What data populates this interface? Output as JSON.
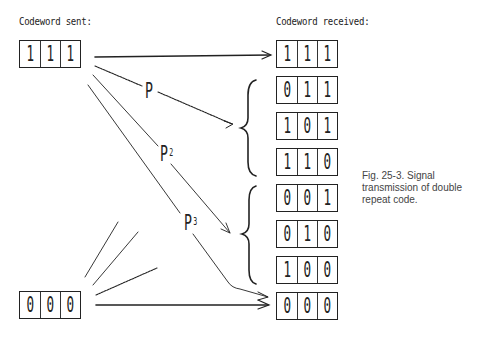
{
  "headings": {
    "sent": "Codeword sent:",
    "received": "Codeword received:"
  },
  "sent_codewords": [
    {
      "bits": [
        "1",
        "1",
        "1"
      ]
    },
    {
      "bits": [
        "0",
        "0",
        "0"
      ]
    }
  ],
  "received_codewords": [
    {
      "bits": [
        "1",
        "1",
        "1"
      ]
    },
    {
      "bits": [
        "0",
        "1",
        "1"
      ]
    },
    {
      "bits": [
        "1",
        "0",
        "1"
      ]
    },
    {
      "bits": [
        "1",
        "1",
        "0"
      ]
    },
    {
      "bits": [
        "0",
        "0",
        "1"
      ]
    },
    {
      "bits": [
        "0",
        "1",
        "0"
      ]
    },
    {
      "bits": [
        "1",
        "0",
        "0"
      ]
    },
    {
      "bits": [
        "0",
        "0",
        "0"
      ]
    }
  ],
  "probability_labels": {
    "p1": {
      "base": "P",
      "exp": ""
    },
    "p2": {
      "base": "P",
      "exp": "2"
    },
    "p3": {
      "base": "P",
      "exp": "3"
    }
  },
  "caption": "Fig. 25-3. Signal transmission of double repeat code.",
  "colors": {
    "ink": "#222222",
    "caption": "#444444",
    "background": "#ffffff"
  }
}
